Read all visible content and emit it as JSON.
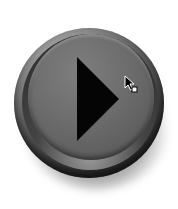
{
  "button": {
    "label": "Play",
    "icon": "play-triangle-icon",
    "state": "hover",
    "colors": {
      "face": "#6e6e6e",
      "bezel": "#2e2e2e",
      "icon": "#050505",
      "background": "#ffffff"
    }
  },
  "cursor": {
    "icon": "arrow-cursor-with-square-icon"
  }
}
